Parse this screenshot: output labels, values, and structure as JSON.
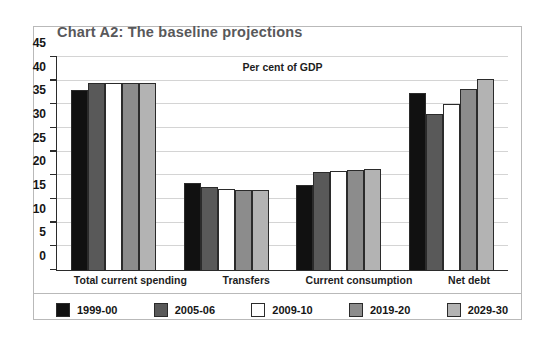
{
  "chart_data": {
    "type": "bar",
    "title": "Chart A2: The baseline projections",
    "subtitle": "Per cent of GDP",
    "xlabel": "",
    "ylabel": "",
    "ylim": [
      0,
      45
    ],
    "yticks": [
      0,
      5,
      10,
      15,
      20,
      25,
      30,
      35,
      40,
      45
    ],
    "ytick_labels": [
      "0",
      "5",
      "10",
      "15",
      "20",
      "25",
      "30",
      "35",
      "40",
      "45"
    ],
    "grid": true,
    "legend_position": "bottom",
    "categories": [
      "Total current spending",
      "Transfers",
      "Current consumption",
      "Net debt"
    ],
    "series": [
      {
        "name": "1999-00",
        "color": "#111111",
        "values": [
          38.0,
          18.3,
          18.0,
          37.4
        ]
      },
      {
        "name": "2005-06",
        "color": "#595959",
        "values": [
          39.5,
          17.5,
          20.7,
          33.0
        ]
      },
      {
        "name": "2009-10",
        "color": "#ffffff",
        "values": [
          39.5,
          17.2,
          21.0,
          35.0
        ]
      },
      {
        "name": "2019-20",
        "color": "#8c8c8c",
        "values": [
          39.5,
          16.8,
          21.2,
          38.2
        ]
      },
      {
        "name": "2029-30",
        "color": "#b3b3b3",
        "values": [
          39.5,
          16.8,
          21.3,
          40.4
        ]
      }
    ]
  }
}
